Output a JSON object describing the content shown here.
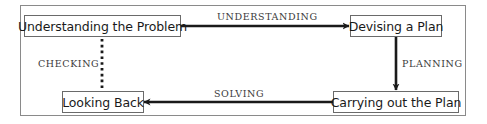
{
  "diagram": {
    "type": "cycle-flow",
    "nodes": [
      {
        "id": "understanding",
        "label": "Understanding the Problem"
      },
      {
        "id": "devising",
        "label": "Devising a Plan"
      },
      {
        "id": "looking-back",
        "label": "Looking Back"
      },
      {
        "id": "carrying-out",
        "label": "Carrying out the Plan"
      }
    ],
    "edges": [
      {
        "from": "understanding",
        "to": "devising",
        "label": "UNDERSTANDING",
        "style": "solid-arrow"
      },
      {
        "from": "devising",
        "to": "carrying-out",
        "label": "PLANNING",
        "style": "solid-arrow"
      },
      {
        "from": "carrying-out",
        "to": "looking-back",
        "label": "SOLVING",
        "style": "solid-arrow"
      },
      {
        "from": "looking-back",
        "to": "understanding",
        "label": "CHECKING",
        "style": "dotted"
      }
    ],
    "colors": {
      "edge": "#1a1a1a",
      "node_border": "#6a6a6a",
      "frame_border": "#8a8a8a",
      "label_text": "#3a3a3a"
    }
  }
}
